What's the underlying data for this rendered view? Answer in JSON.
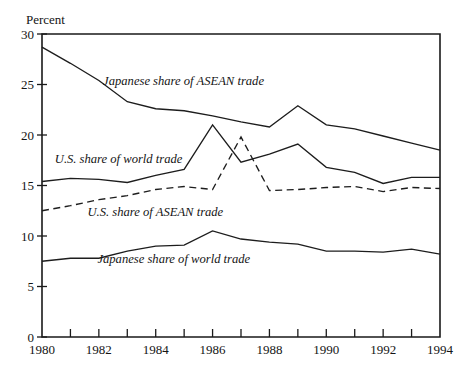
{
  "chart_data": {
    "type": "line",
    "title": "",
    "xlabel": "",
    "ylabel": "Percent",
    "xlim": [
      1980,
      1994
    ],
    "ylim": [
      0,
      30
    ],
    "yticks": [
      0,
      5,
      10,
      15,
      20,
      25,
      30
    ],
    "ytick_labels": [
      "0",
      "5",
      "10",
      "15",
      "20",
      "25",
      "30"
    ],
    "xticks": [
      1980,
      1981,
      1982,
      1983,
      1984,
      1985,
      1986,
      1987,
      1988,
      1989,
      1990,
      1991,
      1992,
      1993,
      1994
    ],
    "xtick_labels_shown": [
      "1980",
      "1982",
      "1984",
      "1986",
      "1988",
      "1990",
      "1992",
      "1994"
    ],
    "grid": false,
    "legend_position": "inline-annotations",
    "x": [
      1980,
      1981,
      1982,
      1983,
      1984,
      1985,
      1986,
      1987,
      1988,
      1989,
      1990,
      1991,
      1992,
      1993,
      1994
    ],
    "series": [
      {
        "name": "Japanese share of ASEAN trade",
        "style": "solid",
        "label_position": {
          "x": 1982.15,
          "y": 25.0
        },
        "values": [
          28.7,
          27.1,
          25.4,
          23.3,
          22.6,
          22.4,
          21.9,
          21.3,
          20.8,
          22.9,
          21.0,
          20.6,
          19.9,
          19.2,
          18.5
        ]
      },
      {
        "name": "U.S. share of world trade",
        "style": "solid",
        "label_position": {
          "x": 1980.45,
          "y": 17.2
        },
        "values": [
          15.4,
          15.7,
          15.6,
          15.3,
          16.0,
          16.6,
          21.0,
          17.3,
          18.1,
          19.1,
          16.8,
          16.3,
          15.2,
          15.8,
          15.8
        ]
      },
      {
        "name": "U.S. share of ASEAN trade",
        "style": "dashed",
        "label_position": {
          "x": 1981.6,
          "y": 12.0
        },
        "values": [
          12.5,
          13.0,
          13.6,
          14.0,
          14.6,
          14.9,
          14.6,
          19.8,
          14.5,
          14.6,
          14.8,
          14.9,
          14.4,
          14.8,
          14.7
        ]
      },
      {
        "name": "Japanese share of world trade",
        "style": "solid",
        "label_position": {
          "x": 1981.95,
          "y": 7.3
        },
        "values": [
          7.5,
          7.8,
          7.8,
          8.5,
          9.0,
          9.1,
          10.5,
          9.7,
          9.4,
          9.2,
          8.5,
          8.5,
          8.4,
          8.7,
          8.2
        ]
      }
    ]
  },
  "colors": {
    "ink": "#1a1a1a",
    "background": "#ffffff"
  }
}
